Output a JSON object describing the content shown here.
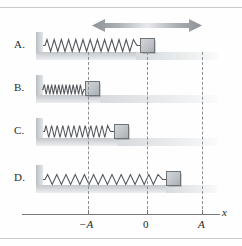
{
  "figure": {
    "width": 242,
    "height": 246,
    "background_color": "#fefefe"
  },
  "arrow": {
    "name": "double-headed-arrow",
    "label": "",
    "color": "#9b9fa3",
    "left": 92,
    "top": 18,
    "width": 110
  },
  "axis": {
    "variable_label": "x",
    "ticks": [
      {
        "label": "−A",
        "x": 88
      },
      {
        "label": "0",
        "x": 147
      },
      {
        "label": "A",
        "x": 202
      }
    ],
    "line_color": "#76797c"
  },
  "dashed_lines": {
    "color": "#8b9095",
    "x_positions": [
      88,
      147,
      202
    ]
  },
  "rows": [
    {
      "label": "A.",
      "name": "option-a",
      "top": 30,
      "wall_x": 36,
      "spring_start": 44,
      "spring_end": 140,
      "coils": 13,
      "block_x": 140,
      "block_size": 13,
      "floor_end": 218,
      "description": "Block at equilibrium position 0 with relaxed spring"
    },
    {
      "label": "B.",
      "name": "option-b",
      "top": 73,
      "wall_x": 36,
      "spring_start": 42,
      "spring_end": 84,
      "coils": 15,
      "block_x": 84,
      "block_size": 13,
      "floor_end": 218,
      "description": "Block at −A with fully compressed spring"
    },
    {
      "label": "C.",
      "name": "option-c",
      "top": 116,
      "wall_x": 36,
      "spring_start": 44,
      "spring_end": 114,
      "coils": 12,
      "block_x": 114,
      "block_size": 13,
      "floor_end": 218,
      "description": "Block between −A and 0 with partly compressed spring"
    },
    {
      "label": "D.",
      "name": "option-d",
      "top": 163,
      "wall_x": 36,
      "spring_start": 44,
      "spring_end": 166,
      "coils": 13,
      "block_x": 166,
      "block_size": 13,
      "floor_end": 218,
      "description": "Block between 0 and A with stretched spring"
    }
  ],
  "colors": {
    "spring": "#55595d",
    "block_border": "#6e7478",
    "floor": "#d6d9dc",
    "wall": "#c6cacd",
    "rule": "#c9cccf"
  }
}
